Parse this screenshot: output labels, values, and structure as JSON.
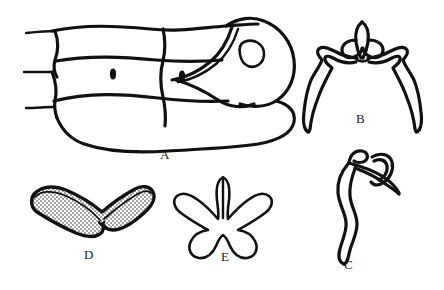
{
  "plate": {
    "title": "Morphological line-drawing plate",
    "background_color": "#ffffff",
    "ink_color": "#111111",
    "width": 444,
    "height": 290,
    "style": "ink line drawing, stippled shading"
  },
  "figures": [
    {
      "key": "A",
      "label": "A",
      "name": "segmented-body-lateral-view",
      "description": "Lateral view of segmented body with head capsule, eye, two oval spiracles and three body segments; short setae lines project from left margin.",
      "label_x": 160,
      "label_y": 148,
      "details": {
        "spiracle_count": 2,
        "eye": "ovate, outlined",
        "segment_lines": 3
      }
    },
    {
      "key": "B",
      "label": "B",
      "name": "paired-symmetric-appendage",
      "description": "Bilaterally symmetric paired sclerite with median vertical projection, interlocking basal hooks and two long tapering descending arms.",
      "label_x": 356,
      "label_y": 112
    },
    {
      "key": "C",
      "label": "C",
      "name": "sinuous-elongate-structure",
      "description": "Single sinuous elongate structure with recurved apical hook and an oblique overlapping branch.",
      "label_x": 344,
      "label_y": 258
    },
    {
      "key": "D",
      "label": "D",
      "name": "v-shaped-stippled-sclerite",
      "description": "Broad V-shaped boomerang sclerite, thick outline, interior filled with fine regular stippling.",
      "label_x": 84,
      "label_y": 248
    },
    {
      "key": "E",
      "label": "E",
      "name": "five-lobed-floral-sclerite",
      "description": "Five-lobed sclerite resembling a flower: one erect median prong, two lateral outstretched lobes, two rounded ventral lobes.",
      "label_x": 221,
      "label_y": 250
    }
  ],
  "label_font_size_px": 13
}
